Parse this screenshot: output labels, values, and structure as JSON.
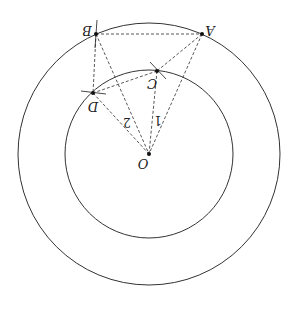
{
  "diagram": {
    "orientation": "rotated 180 degrees",
    "center": {
      "label": "O",
      "x": 149,
      "y": 154
    },
    "circles": [
      {
        "name": "outer-circle",
        "cx": 149,
        "cy": 154,
        "r": 131
      },
      {
        "name": "inner-circle",
        "cx": 149,
        "cy": 154,
        "r": 84
      }
    ],
    "points": {
      "A": {
        "label": "A",
        "x": 202,
        "y": 34
      },
      "B": {
        "label": "B",
        "x": 96,
        "y": 34
      },
      "C": {
        "label": "C",
        "x": 157,
        "y": 71
      },
      "D": {
        "label": "D",
        "x": 93,
        "y": 93
      }
    },
    "segment_labels": {
      "one": "1",
      "two": "2"
    },
    "colors": {
      "stroke": "#333333",
      "dashed": "#444444"
    }
  }
}
